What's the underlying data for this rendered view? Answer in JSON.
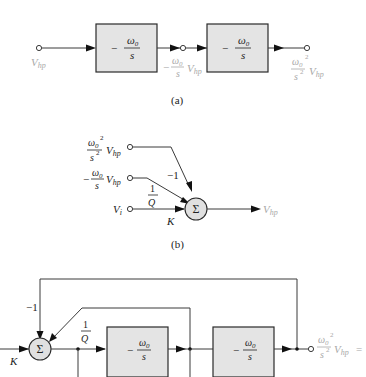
{
  "figure": {
    "colors": {
      "line": "#3a3a3a",
      "block_fill": "#e4e4e4",
      "signal_label": "#a8a8a8",
      "gain_label": "#222222"
    },
    "part_a": {
      "caption": "(a)",
      "input_label": "V",
      "input_sub": "hp",
      "blocks": [
        {
          "num": "ω",
          "num_sub": "0",
          "sign": "−",
          "den": "s"
        },
        {
          "num": "ω",
          "num_sub": "0",
          "sign": "−",
          "den": "s"
        }
      ],
      "mid_label": {
        "sign": "−",
        "num": "ω",
        "num_sub": "0",
        "den": "s",
        "v": "V",
        "v_sub": "hp"
      },
      "output_label": {
        "num": "ω",
        "num_sub": "0",
        "num_sup": "2",
        "den": "s",
        "den_sup": "2",
        "v": "V",
        "v_sub": "hp"
      }
    },
    "part_b": {
      "caption": "(b)",
      "inputs": [
        {
          "num": "ω",
          "num_sub": "0",
          "num_sup": "2",
          "den": "s",
          "den_sup": "2",
          "v": "V",
          "v_sub": "hp",
          "gain": "−1"
        },
        {
          "sign": "−",
          "num": "ω",
          "num_sub": "0",
          "den": "s",
          "v": "V",
          "v_sub": "hp",
          "gain_num": "1",
          "gain_den": "Q"
        },
        {
          "v": "V",
          "v_sub": "i",
          "gain": "K"
        }
      ],
      "summer_symbol": "Σ",
      "output_label": "V",
      "output_sub": "hp"
    },
    "part_c": {
      "feedback_gain_outer": "−1",
      "feedback_gain_inner_num": "1",
      "feedback_gain_inner_den": "Q",
      "input_gain": "K",
      "summer_symbol": "Σ",
      "blocks": [
        {
          "num": "ω",
          "num_sub": "0",
          "sign": "−",
          "den": "s"
        },
        {
          "num": "ω",
          "num_sub": "0",
          "sign": "−",
          "den": "s"
        }
      ],
      "output_label": {
        "num": "ω",
        "num_sub": "0",
        "num_sup": "2",
        "den": "s",
        "den_sup": "2",
        "v": "V",
        "v_sub": "hp",
        "suffix": "="
      }
    }
  }
}
